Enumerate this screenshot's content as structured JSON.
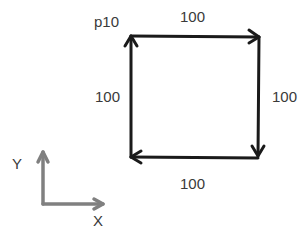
{
  "diagram": {
    "start_point_label": "p10",
    "edges": [
      {
        "name": "top",
        "label": "100",
        "direction": "right"
      },
      {
        "name": "right",
        "label": "100",
        "direction": "down"
      },
      {
        "name": "bottom",
        "label": "100",
        "direction": "left"
      },
      {
        "name": "left",
        "label": "100",
        "direction": "up"
      }
    ],
    "axes": {
      "x_label": "X",
      "y_label": "Y"
    },
    "colors": {
      "path": "#1a1a1a",
      "axes": "#808080",
      "text": "#3a3a3a"
    }
  }
}
